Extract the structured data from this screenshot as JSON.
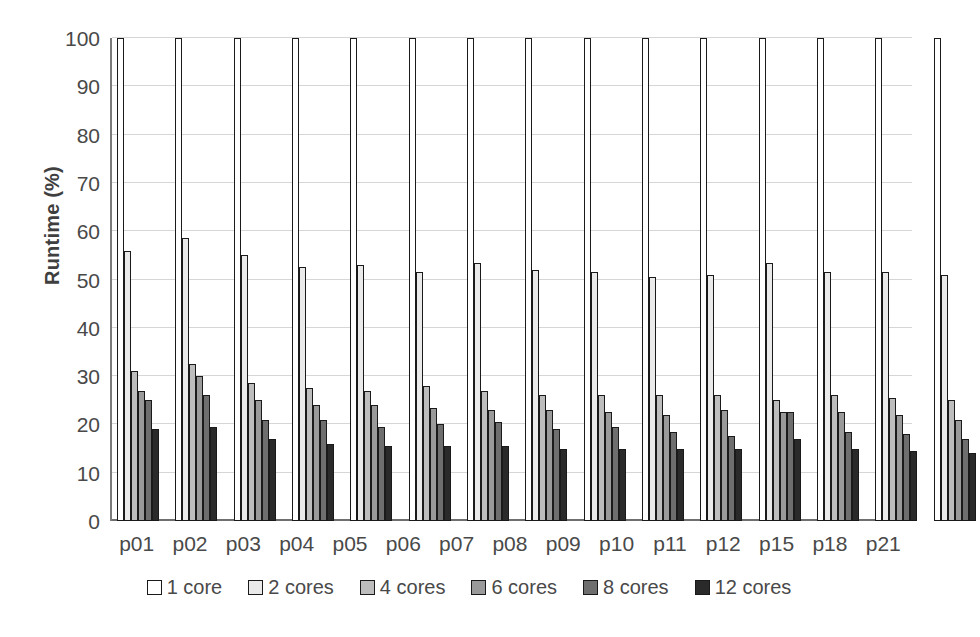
{
  "chart_data": {
    "type": "bar",
    "title": "",
    "subtitle": "",
    "xlabel": "",
    "ylabel": "Runtime (%)",
    "ylim": [
      0,
      100
    ],
    "ytick_step": 10,
    "yticks": [
      0,
      10,
      20,
      30,
      40,
      50,
      60,
      70,
      80,
      90,
      100
    ],
    "grid": true,
    "legend_position": "bottom",
    "categories": [
      "p01",
      "p02",
      "p03",
      "p04",
      "p05",
      "p06",
      "p07",
      "p08",
      "p09",
      "p10",
      "p11",
      "p12",
      "p15",
      "p18",
      "p21"
    ],
    "series": [
      {
        "name": "1 core",
        "color": "#ffffff",
        "values": [
          100,
          100,
          100,
          100,
          100,
          100,
          100,
          100,
          100,
          100,
          100,
          100,
          100,
          100,
          100
        ]
      },
      {
        "name": "2 cores",
        "color": "#eaeaea",
        "values": [
          56,
          58.5,
          55,
          52.5,
          53,
          51.5,
          53.5,
          52,
          51.5,
          50.5,
          51,
          53.5,
          51.5,
          51.5,
          51
        ]
      },
      {
        "name": "4 cores",
        "color": "#bdbdbd",
        "values": [
          31,
          32.5,
          28.5,
          27.5,
          27,
          28,
          27,
          26,
          26,
          26,
          26,
          25,
          26,
          25.5,
          25
        ]
      },
      {
        "name": "6 cores",
        "color": "#9a9a9a",
        "values": [
          27,
          30,
          25,
          24,
          24,
          23.5,
          23,
          23,
          22.5,
          22,
          23,
          22.5,
          22.5,
          22,
          21
        ]
      },
      {
        "name": "8 cores",
        "color": "#6e6e6e",
        "values": [
          25,
          26,
          21,
          21,
          19.5,
          20,
          20.5,
          19,
          19.5,
          18.5,
          17.5,
          22.5,
          18.5,
          18,
          17
        ]
      },
      {
        "name": "12 cores",
        "color": "#2a2a2a",
        "values": [
          19,
          19.5,
          17,
          16,
          15.5,
          15.5,
          15.5,
          15,
          15,
          15,
          15,
          17,
          15,
          14.5,
          14
        ]
      }
    ]
  },
  "axis": {
    "y_title": "Runtime (%)"
  },
  "legend": {
    "items": [
      {
        "label": "1 core"
      },
      {
        "label": "2 cores"
      },
      {
        "label": "4 cores"
      },
      {
        "label": "6 cores"
      },
      {
        "label": "8 cores"
      },
      {
        "label": "12 cores"
      }
    ]
  }
}
